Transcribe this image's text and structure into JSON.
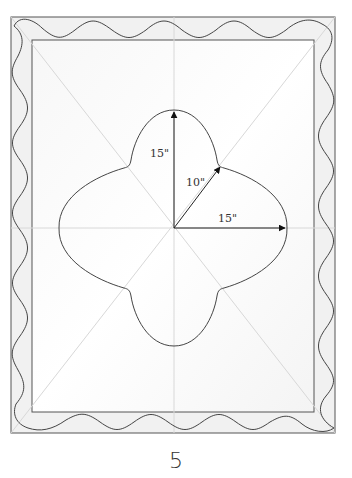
{
  "diagram": {
    "labels": {
      "vertical_radius": "15\"",
      "diagonal_radius": "10\"",
      "horizontal_radius": "15\""
    },
    "measurements": [
      {
        "direction": "vertical",
        "value_in": 15
      },
      {
        "direction": "diagonal",
        "value_in": 10
      },
      {
        "direction": "horizontal",
        "value_in": 15
      }
    ],
    "colors": {
      "line": "#444444",
      "guide": "#d6d6d6",
      "border_fill": "#f1f1f1",
      "field_fill": "#fafafa"
    }
  },
  "page": {
    "number": "5"
  }
}
